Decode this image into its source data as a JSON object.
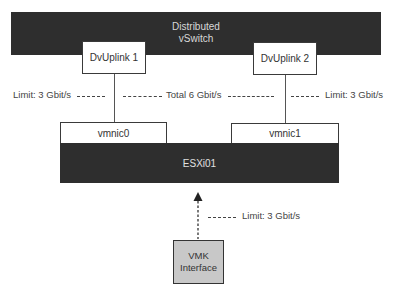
{
  "diagram": {
    "vswitch": {
      "label_line1": "Distributed",
      "label_line2": "vSwitch"
    },
    "uplinks": [
      {
        "label": "DvUplink 1"
      },
      {
        "label": "DvUplink 2"
      }
    ],
    "limits": {
      "left": "Limit: 3 Gbit/s",
      "total": "Total 6 Gbit/s",
      "right": "Limit: 3 Gbit/s",
      "vmk": "Limit: 3 Gbit/s"
    },
    "vmnics": [
      {
        "label": "vmnic0"
      },
      {
        "label": "vmnic1"
      }
    ],
    "host": {
      "label": "ESXi01"
    },
    "vmk": {
      "label_line1": "VMK",
      "label_line2": "Interface"
    },
    "colors": {
      "dark_block": "#2e2e2e",
      "vmk_fill": "#c8c8c8",
      "line": "#555555"
    }
  }
}
